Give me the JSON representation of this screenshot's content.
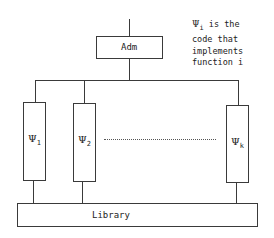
{
  "diagram": {
    "top_box": {
      "label": "Adm"
    },
    "modules": [
      {
        "symbol": "Ψ",
        "subscript": "1"
      },
      {
        "symbol": "Ψ",
        "subscript": "2"
      },
      {
        "symbol": "Ψ",
        "subscript": "k"
      }
    ],
    "ellipsis": "......................",
    "bottom_box": {
      "label": "Library"
    },
    "annotation": {
      "symbol": "Ψ",
      "subscript": "i",
      "line1_rest": " is the",
      "line2": "code that",
      "line3": "implements",
      "line4": "function i"
    }
  }
}
